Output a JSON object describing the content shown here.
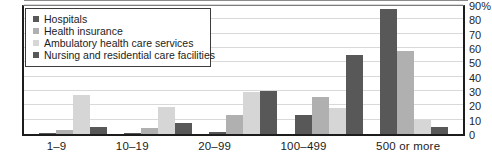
{
  "chart_data": {
    "type": "bar",
    "title": "",
    "subtitle": "",
    "xlabel": "",
    "ylabel": "",
    "ylim": [
      0,
      90
    ],
    "ytick_labels": [
      "90%",
      "80",
      "70",
      "60",
      "50",
      "40",
      "30",
      "20",
      "10",
      "0"
    ],
    "ytick_values": [
      90,
      80,
      70,
      60,
      50,
      40,
      30,
      20,
      10,
      0
    ],
    "grid": true,
    "legend_position": "top-left",
    "categories": [
      "1–9",
      "10–19",
      "20–99",
      "100–499",
      "500 or more"
    ],
    "series": [
      {
        "name": "Hospitals",
        "color": "#585858",
        "values": [
          0.5,
          1,
          1.5,
          13,
          87
        ]
      },
      {
        "name": "Health insurance",
        "color": "#b0b0b0",
        "values": [
          3,
          4,
          13,
          26,
          58
        ]
      },
      {
        "name": "Ambulatory health care services",
        "color": "#d6d6d6",
        "values": [
          27,
          19,
          29,
          18,
          10
        ]
      },
      {
        "name": "Nursing and residential care facilities",
        "color": "#585858",
        "values": [
          5,
          8,
          30,
          55,
          5
        ]
      }
    ]
  },
  "legend": {
    "items": [
      {
        "label": "Hospitals",
        "color": "#585858"
      },
      {
        "label": "Health insurance",
        "color": "#b0b0b0"
      },
      {
        "label": "Ambulatory health care services",
        "color": "#d6d6d6"
      },
      {
        "label": "Nursing and residential care facilities",
        "color": "#585858"
      }
    ]
  },
  "colors": {
    "axis": "#1c1c1c",
    "gridline": "#d9d9d9",
    "background": "#ffffff",
    "text": "#1c1c1c"
  }
}
